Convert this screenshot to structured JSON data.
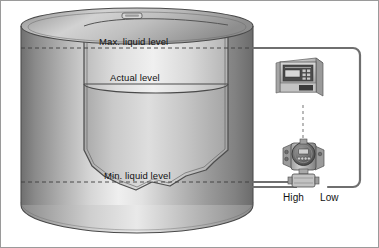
{
  "diagram": {
    "tank": {
      "name": "storage-tank",
      "hatch": "tank-top-hatch",
      "cutaway": "torn-cutaway-edge"
    },
    "labels": {
      "max_level": "Max. liquid level",
      "actual_level": "Actual level",
      "min_level": "Min. liquid level",
      "high_port": "High",
      "low_port": "Low"
    },
    "devices": {
      "controller": {
        "name": "controller-display-unit",
        "display": "controller-lcd-screen",
        "keypad": "controller-keypad"
      },
      "transmitter": {
        "name": "differential-pressure-transmitter",
        "display": "transmitter-lcd-display",
        "buttons": "transmitter-button-row",
        "manifold": "transmitter-valve-manifold"
      }
    },
    "connections": {
      "low_impulse_line": "low-side-impulse-line",
      "high_impulse_line": "high-side-impulse-line",
      "signal_cable": "controller-signal-cable"
    },
    "colors": {
      "tank_dark": "#7c7c7c",
      "tank_mid": "#a8a8a8",
      "tank_highlight": "#ececec",
      "liquid": "#c4c4c4",
      "outline": "#3a3a3a",
      "pipe": "#6d6d6d",
      "device_body": "#b9b9b9",
      "device_dark": "#4a4a4a",
      "text": "#111111",
      "border": "#9a9a9a"
    }
  }
}
